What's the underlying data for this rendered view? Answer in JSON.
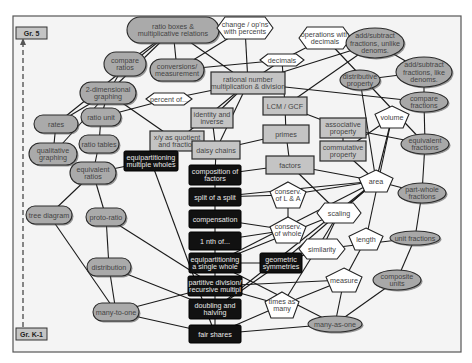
{
  "diagram": {
    "grade_top": "Gr. 5",
    "grade_bottom": "Gr. K-1",
    "colors": {
      "pill_fill": "#aaaaaa",
      "rect_fill": "#c4c4c4",
      "dark_fill": "#111111",
      "poly_fill": "#ffffff",
      "line": "#1a1a1a"
    },
    "nodes": [
      {
        "id": "ratio_boxes",
        "shape": "pill",
        "x": 173,
        "y": 30,
        "w": 92,
        "h": 26,
        "lines": [
          "ratio boxes &",
          "multiplicative relations"
        ]
      },
      {
        "id": "compare_ratios",
        "shape": "pill",
        "x": 125,
        "y": 64,
        "w": 42,
        "h": 24,
        "lines": [
          "compare",
          "ratios"
        ]
      },
      {
        "id": "two_d_graphing",
        "shape": "pill",
        "x": 108,
        "y": 93,
        "w": 56,
        "h": 22,
        "lines": [
          "2-dimensional",
          "graphing"
        ]
      },
      {
        "id": "rates",
        "shape": "pill",
        "x": 56,
        "y": 124,
        "w": 44,
        "h": 18,
        "lines": [
          "rates"
        ]
      },
      {
        "id": "ratio_unit",
        "shape": "pill",
        "x": 101,
        "y": 117,
        "w": 40,
        "h": 18,
        "lines": [
          "ratio unit"
        ]
      },
      {
        "id": "qualitative_graphing",
        "shape": "pill",
        "x": 53,
        "y": 154,
        "w": 48,
        "h": 22,
        "lines": [
          "qualitative",
          "graphing"
        ]
      },
      {
        "id": "ratio_tables",
        "shape": "pill",
        "x": 99,
        "y": 144,
        "w": 40,
        "h": 18,
        "lines": [
          "ratio tables"
        ]
      },
      {
        "id": "equivalent_ratios",
        "shape": "pill",
        "x": 93,
        "y": 173,
        "w": 46,
        "h": 22,
        "lines": [
          "equivalent",
          "ratios"
        ]
      },
      {
        "id": "tree_diagram",
        "shape": "pill",
        "x": 49,
        "y": 215,
        "w": 46,
        "h": 18,
        "lines": [
          "tree diagram"
        ]
      },
      {
        "id": "proto_ratio",
        "shape": "pill",
        "x": 106,
        "y": 217,
        "w": 40,
        "h": 18,
        "lines": [
          "proto-ratio"
        ]
      },
      {
        "id": "distribution",
        "shape": "pill",
        "x": 109,
        "y": 267,
        "w": 44,
        "h": 18,
        "lines": [
          "distribution"
        ]
      },
      {
        "id": "many_to_one",
        "shape": "pill",
        "x": 116,
        "y": 312,
        "w": 46,
        "h": 18,
        "lines": [
          "many-to-one"
        ]
      },
      {
        "id": "conversions",
        "shape": "pill",
        "x": 177,
        "y": 70,
        "w": 54,
        "h": 22,
        "lines": [
          "conversions/",
          "measurement"
        ]
      },
      {
        "id": "ratio_small_left",
        "shape": "pill",
        "x": 150,
        "y": 82,
        "w": 10,
        "h": 20,
        "lines": [
          ""
        ]
      },
      {
        "id": "change_percents",
        "shape": "hex",
        "x": 245,
        "y": 28,
        "w": 56,
        "h": 22,
        "lines": [
          "change / op'ns",
          "with percents"
        ]
      },
      {
        "id": "ops_decimals",
        "shape": "hex",
        "x": 325,
        "y": 38,
        "w": 52,
        "h": 22,
        "lines": [
          "operations with",
          "decimals"
        ]
      },
      {
        "id": "decimals",
        "shape": "hex",
        "x": 282,
        "y": 60,
        "w": 44,
        "h": 12,
        "lines": [
          "decimals"
        ]
      },
      {
        "id": "percent_of",
        "shape": "hex",
        "x": 169,
        "y": 99,
        "w": 46,
        "h": 12,
        "lines": [
          "percent of..."
        ]
      },
      {
        "id": "rational_number",
        "shape": "rect",
        "x": 248,
        "y": 83,
        "w": 74,
        "h": 22,
        "lines": [
          "rational number",
          "multiplication & division"
        ]
      },
      {
        "id": "xy_quotient",
        "shape": "rect",
        "x": 102,
        "y": 156,
        "w": 0,
        "h": 0,
        "lines": []
      },
      {
        "id": "xy_as_quotient",
        "shape": "rect",
        "x": 177,
        "y": 141,
        "w": 54,
        "h": 20,
        "lines": [
          "x/y as quotient",
          "and fraction"
        ]
      },
      {
        "id": "identity_inverse",
        "shape": "rect",
        "x": 212,
        "y": 118,
        "w": 42,
        "h": 20,
        "lines": [
          "identity and",
          "inverse"
        ]
      },
      {
        "id": "daisy_chains",
        "shape": "rect",
        "x": 216,
        "y": 150,
        "w": 48,
        "h": 18,
        "lines": [
          "daisy chains"
        ]
      },
      {
        "id": "lcm_gcf",
        "shape": "rect",
        "x": 285,
        "y": 106,
        "w": 44,
        "h": 18,
        "lines": [
          "LCM / GCF"
        ]
      },
      {
        "id": "primes",
        "shape": "rect",
        "x": 286,
        "y": 134,
        "w": 46,
        "h": 18,
        "lines": [
          "primes"
        ]
      },
      {
        "id": "factors",
        "shape": "rect",
        "x": 290,
        "y": 165,
        "w": 48,
        "h": 18,
        "lines": [
          "factors"
        ]
      },
      {
        "id": "associative",
        "shape": "rect",
        "x": 343,
        "y": 128,
        "w": 46,
        "h": 20,
        "lines": [
          "associative",
          "property"
        ]
      },
      {
        "id": "commutative",
        "shape": "rect",
        "x": 343,
        "y": 151,
        "w": 46,
        "h": 20,
        "lines": [
          "commutative",
          "property"
        ]
      },
      {
        "id": "lcm_right_stub",
        "shape": "rect",
        "x": 0,
        "y": 0,
        "w": 0,
        "h": 0,
        "lines": []
      },
      {
        "id": "equipart_multiple",
        "shape": "dark",
        "x": 151,
        "y": 161,
        "w": 54,
        "h": 20,
        "lines": [
          "equipartitioning",
          "multiple wholes"
        ]
      },
      {
        "id": "composition_factors",
        "shape": "dark",
        "x": 215,
        "y": 175,
        "w": 52,
        "h": 20,
        "lines": [
          "composition of",
          "factors"
        ]
      },
      {
        "id": "split_of_split",
        "shape": "dark",
        "x": 215,
        "y": 197,
        "w": 52,
        "h": 18,
        "lines": [
          "split of a split"
        ]
      },
      {
        "id": "compensation",
        "shape": "dark",
        "x": 215,
        "y": 219,
        "w": 52,
        "h": 18,
        "lines": [
          "compensation"
        ]
      },
      {
        "id": "one_nth_of",
        "shape": "dark",
        "x": 215,
        "y": 241,
        "w": 52,
        "h": 18,
        "lines": [
          "1 nth of..."
        ]
      },
      {
        "id": "equipart_single",
        "shape": "dark",
        "x": 215,
        "y": 263,
        "w": 52,
        "h": 20,
        "lines": [
          "equipartitioning",
          "a single whole"
        ]
      },
      {
        "id": "partitive_division",
        "shape": "dark",
        "x": 215,
        "y": 286,
        "w": 54,
        "h": 20,
        "lines": [
          "partitive division/",
          "recursive multipl"
        ]
      },
      {
        "id": "doubling_halving",
        "shape": "dark",
        "x": 215,
        "y": 309,
        "w": 52,
        "h": 20,
        "lines": [
          "doubling and",
          "halving"
        ]
      },
      {
        "id": "fair_shares",
        "shape": "dark",
        "x": 215,
        "y": 334,
        "w": 52,
        "h": 18,
        "lines": [
          "fair shares"
        ]
      },
      {
        "id": "geometric_symmetries",
        "shape": "dark",
        "x": 281,
        "y": 263,
        "w": 42,
        "h": 20,
        "lines": [
          "geometric",
          "symmetries"
        ]
      },
      {
        "id": "add_sub_unlike",
        "shape": "ellipse",
        "x": 375,
        "y": 43,
        "w": 58,
        "h": 30,
        "lines": [
          "add/subtract",
          "fractions, unlike",
          "denoms."
        ]
      },
      {
        "id": "add_sub_like",
        "shape": "ellipse",
        "x": 424,
        "y": 72,
        "w": 56,
        "h": 30,
        "lines": [
          "add/subtract",
          "fractions, like",
          "denoms."
        ]
      },
      {
        "id": "distributive",
        "shape": "ellipse",
        "x": 360,
        "y": 80,
        "w": 40,
        "h": 20,
        "lines": [
          "distributive",
          "property"
        ]
      },
      {
        "id": "compare_fractions",
        "shape": "ellipse",
        "x": 424,
        "y": 102,
        "w": 48,
        "h": 20,
        "lines": [
          "compare",
          "fractions"
        ]
      },
      {
        "id": "equivalent_fractions",
        "shape": "ellipse",
        "x": 425,
        "y": 144,
        "w": 48,
        "h": 20,
        "lines": [
          "equivalent",
          "fractions"
        ]
      },
      {
        "id": "part_whole",
        "shape": "ellipse",
        "x": 422,
        "y": 193,
        "w": 48,
        "h": 20,
        "lines": [
          "part-whole",
          "fractions"
        ]
      },
      {
        "id": "unit_fractions",
        "shape": "ellipse",
        "x": 415,
        "y": 238,
        "w": 50,
        "h": 14,
        "lines": [
          "unit fractions"
        ]
      },
      {
        "id": "composite_units",
        "shape": "ellipse",
        "x": 397,
        "y": 280,
        "w": 48,
        "h": 20,
        "lines": [
          "composite",
          "units"
        ]
      },
      {
        "id": "many_as_one",
        "shape": "ellipse",
        "x": 335,
        "y": 324,
        "w": 54,
        "h": 16,
        "lines": [
          "many-as-one"
        ]
      },
      {
        "id": "volume",
        "shape": "pent",
        "x": 392,
        "y": 117,
        "w": 34,
        "h": 22,
        "lines": [
          "volume"
        ]
      },
      {
        "id": "area",
        "shape": "pent",
        "x": 376,
        "y": 181,
        "w": 34,
        "h": 22,
        "lines": [
          "area"
        ]
      },
      {
        "id": "conserv_la",
        "shape": "pent",
        "x": 288,
        "y": 195,
        "w": 36,
        "h": 26,
        "lines": [
          "conserv.",
          "of L & A"
        ]
      },
      {
        "id": "conserv_whole",
        "shape": "pent",
        "x": 288,
        "y": 230,
        "w": 36,
        "h": 26,
        "lines": [
          "conserv.",
          "of whole"
        ]
      },
      {
        "id": "length",
        "shape": "pent",
        "x": 366,
        "y": 239,
        "w": 34,
        "h": 22,
        "lines": [
          "length"
        ]
      },
      {
        "id": "measure",
        "shape": "pent",
        "x": 344,
        "y": 280,
        "w": 36,
        "h": 24,
        "lines": [
          "measure"
        ]
      },
      {
        "id": "times_as_many",
        "shape": "pent",
        "x": 282,
        "y": 305,
        "w": 34,
        "h": 26,
        "lines": [
          "times as",
          "many"
        ]
      },
      {
        "id": "scaling",
        "shape": "hex",
        "x": 339,
        "y": 213,
        "w": 44,
        "h": 20,
        "lines": [
          "scaling"
        ]
      },
      {
        "id": "similarity",
        "shape": "hex",
        "x": 322,
        "y": 249,
        "w": 46,
        "h": 20,
        "lines": [
          "similarity"
        ]
      }
    ]
  }
}
